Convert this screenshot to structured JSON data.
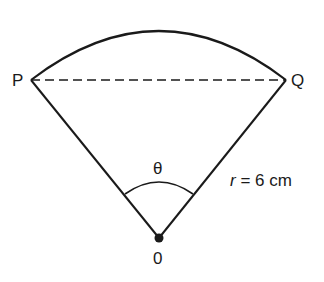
{
  "diagram": {
    "type": "sector",
    "points": {
      "P": "P",
      "Q": "Q",
      "O": "0"
    },
    "angle_label": "θ",
    "radius": {
      "symbol": "r",
      "equals": " = 6 cm"
    },
    "colors": {
      "stroke": "#1a1a1a",
      "background": "#ffffff"
    }
  }
}
